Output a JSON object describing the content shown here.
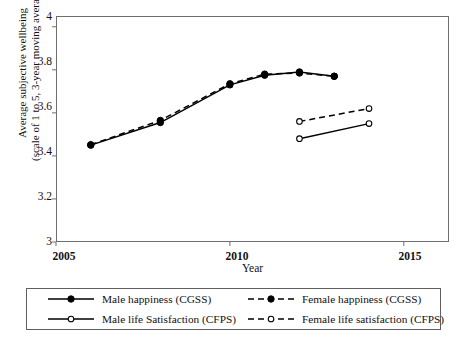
{
  "chart_data": {
    "type": "line",
    "title": "",
    "xlabel": "Year",
    "ylabel": "Average subjective wellbeing (scale of 1 to 5, 3-year moving average)",
    "ylabel_line1": "Average subjective wellbeing",
    "ylabel_line2": "(scale of 1 to 5, 3-year moving average)",
    "xlim": [
      2005,
      2016.3
    ],
    "ylim": [
      3,
      4.05
    ],
    "xticks": [
      2005,
      2010,
      2015
    ],
    "xtick_labels": [
      "2005",
      "2010",
      "2015"
    ],
    "yticks": [
      3,
      3.2,
      3.4,
      3.6,
      3.8,
      4
    ],
    "ytick_labels": [
      "3",
      "3.2",
      "3.4",
      "3.6",
      "3.8",
      "4"
    ],
    "grid": false,
    "legend_position": "below-axes",
    "series": [
      {
        "name": "Male happiness (CGSS)",
        "legend_key": "solid-filled-circle",
        "line_style": "solid",
        "marker": "filled-circle",
        "color": "#000000",
        "x": [
          2006,
          2008,
          2010,
          2011,
          2012,
          2013
        ],
        "y": [
          3.45,
          3.555,
          3.73,
          3.775,
          3.79,
          3.77
        ]
      },
      {
        "name": "Female happiness (CGSS)",
        "legend_key": "dashed-filled-circle",
        "line_style": "dashed",
        "marker": "filled-circle",
        "color": "#000000",
        "x": [
          2006,
          2008,
          2010,
          2011,
          2012,
          2013
        ],
        "y": [
          3.452,
          3.565,
          3.735,
          3.78,
          3.785,
          3.77
        ]
      },
      {
        "name": "Male life Satisfaction (CFPS)",
        "legend_key": "solid-hollow-circle",
        "line_style": "solid",
        "marker": "hollow-circle",
        "color": "#000000",
        "x": [
          2012,
          2014
        ],
        "y": [
          3.48,
          3.55
        ]
      },
      {
        "name": "Female life satisfaction (CFPS)",
        "legend_key": "dashed-hollow-circle",
        "line_style": "dashed",
        "marker": "hollow-circle",
        "color": "#000000",
        "x": [
          2012,
          2014
        ],
        "y": [
          3.56,
          3.62
        ]
      }
    ]
  },
  "axes": {
    "x_title": "Year",
    "y_title_line1": "Average subjective wellbeing",
    "y_title_line2": "(scale of 1 to 5, 3-year moving average)",
    "x_tick_labels": [
      "2005",
      "2010",
      "2015"
    ],
    "y_tick_labels": [
      "4",
      "3.8",
      "3.6",
      "3.4",
      "3.2",
      "3"
    ]
  },
  "legend": {
    "entries": [
      {
        "label": "Male happiness (CGSS)",
        "key": "solid-filled-circle"
      },
      {
        "label": "Female happiness (CGSS)",
        "key": "dashed-filled-circle"
      },
      {
        "label": "Male life Satisfaction (CFPS)",
        "key": "solid-hollow-circle"
      },
      {
        "label": "Female life satisfaction (CFPS)",
        "key": "dashed-hollow-circle"
      }
    ]
  },
  "colors": {
    "line": "#000000",
    "frame": "#6e6e6e",
    "text": "#111111",
    "background": "#ffffff"
  }
}
